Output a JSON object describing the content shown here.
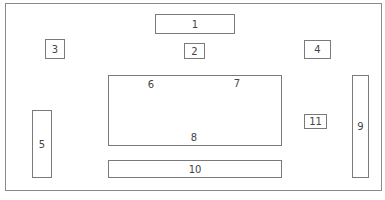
{
  "diagram": {
    "type": "layout-plan",
    "boxes": [
      {
        "id": "1",
        "label": "1"
      },
      {
        "id": "2",
        "label": "2"
      },
      {
        "id": "3",
        "label": "3"
      },
      {
        "id": "4",
        "label": "4"
      },
      {
        "id": "5",
        "label": "5"
      },
      {
        "id": "central",
        "labels": [
          "6",
          "7",
          "8"
        ]
      },
      {
        "id": "9",
        "label": "9"
      },
      {
        "id": "10",
        "label": "10"
      },
      {
        "id": "11",
        "label": "11"
      }
    ]
  },
  "labels": {
    "b1": "1",
    "b2": "2",
    "b3": "3",
    "b4": "4",
    "b5": "5",
    "c6": "6",
    "c7": "7",
    "c8": "8",
    "b9": "9",
    "b10": "10",
    "b11": "11"
  },
  "colors": {
    "stroke": "#7a7a7a",
    "background": "#ffffff",
    "text": "#444444"
  }
}
